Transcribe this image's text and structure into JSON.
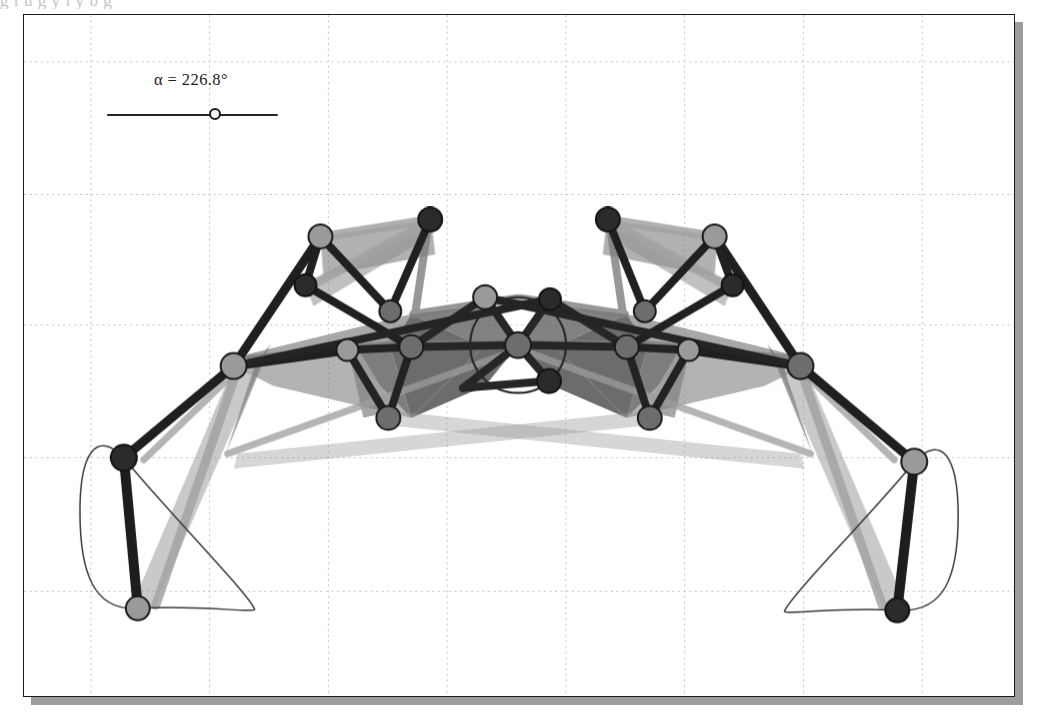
{
  "page": {
    "background": "#ffffff",
    "bleed_text": "g           l     u     g  y     l  y       b     g",
    "width": 1044,
    "height": 718
  },
  "applet": {
    "frame": {
      "x": 23,
      "y": 14,
      "width": 992,
      "height": 683,
      "border_color": "#1b1b1b",
      "background": "#ffffff",
      "shadow_color": "#9d9d9d",
      "shadow_offset": 8
    },
    "grid": {
      "visible": true,
      "style": "dotted",
      "color": "#c9c9c9",
      "x_lines": [
        90,
        209,
        328,
        447,
        566,
        685,
        804,
        923
      ],
      "y_lines": [
        61,
        194,
        325,
        458,
        592
      ],
      "spacing_x": 119,
      "spacing_y": 133
    }
  },
  "slider": {
    "name": "alpha",
    "label": "α = 226.8°",
    "symbol": "α",
    "value": 226.8,
    "unit": "°",
    "min": 0,
    "max": 360,
    "track": {
      "x": 83,
      "y": 99,
      "length": 171
    },
    "knob_x": 189,
    "track_color": "#262626",
    "knob_fill": "#f2f2f2",
    "knob_stroke": "#1c1c1c"
  },
  "colors": {
    "joint_dark": "#2b2b2b",
    "joint_light": "#9a9a9a",
    "joint_mid": "#6d6d6d",
    "joint_outline": "#1a1a1a",
    "bar_dark": "#1d1d1d",
    "bar_mid": "#4d4d4d",
    "bar_light": "#8f8f8f",
    "ghost": "#b5b5b5",
    "trace": "#3a3a3a",
    "fill_panel": "#4a4a4a"
  },
  "mechanism": {
    "type": "klann-walking-linkage",
    "description": "Symmetric two-legged walking linkage driven by a central crank circle",
    "crank_circle": {
      "cx": 518,
      "cy": 345,
      "r": 48,
      "stroke": "#2a2a2a"
    },
    "joints": [
      {
        "id": "hub",
        "x": 518,
        "y": 345,
        "r": 13,
        "shade": "mid"
      },
      {
        "id": "c-tl",
        "x": 485,
        "y": 297,
        "r": 12,
        "shade": "light"
      },
      {
        "id": "c-tr",
        "x": 550,
        "y": 299,
        "r": 11,
        "shade": "dark"
      },
      {
        "id": "c-br",
        "x": 549,
        "y": 381,
        "r": 12,
        "shade": "dark"
      },
      {
        "id": "L-top",
        "x": 320,
        "y": 236,
        "r": 12,
        "shade": "light"
      },
      {
        "id": "L-upper",
        "x": 305,
        "y": 285,
        "r": 11,
        "shade": "dark"
      },
      {
        "id": "L-peak",
        "x": 430,
        "y": 219,
        "r": 12,
        "shade": "dark"
      },
      {
        "id": "L-mid",
        "x": 390,
        "y": 311,
        "r": 11,
        "shade": "mid"
      },
      {
        "id": "L-inner",
        "x": 411,
        "y": 347,
        "r": 12,
        "shade": "mid"
      },
      {
        "id": "L-knee",
        "x": 347,
        "y": 350,
        "r": 11,
        "shade": "light"
      },
      {
        "id": "L-hip",
        "x": 233,
        "y": 366,
        "r": 13,
        "shade": "light"
      },
      {
        "id": "L-low",
        "x": 388,
        "y": 418,
        "r": 12,
        "shade": "mid"
      },
      {
        "id": "L-ankle",
        "x": 123,
        "y": 458,
        "r": 13,
        "shade": "dark"
      },
      {
        "id": "L-foot",
        "x": 137,
        "y": 609,
        "r": 12,
        "shade": "light"
      },
      {
        "id": "R-top",
        "x": 715,
        "y": 236,
        "r": 12,
        "shade": "light"
      },
      {
        "id": "R-upper",
        "x": 733,
        "y": 285,
        "r": 11,
        "shade": "dark"
      },
      {
        "id": "R-peak",
        "x": 608,
        "y": 219,
        "r": 12,
        "shade": "dark"
      },
      {
        "id": "R-mid",
        "x": 648,
        "y": 311,
        "r": 11,
        "shade": "mid"
      },
      {
        "id": "R-inner",
        "x": 625,
        "y": 347,
        "r": 12,
        "shade": "mid"
      },
      {
        "id": "R-knee",
        "x": 689,
        "y": 350,
        "r": 11,
        "shade": "light"
      },
      {
        "id": "R-hip",
        "x": 801,
        "y": 366,
        "r": 13,
        "shade": "mid"
      },
      {
        "id": "R-low",
        "x": 650,
        "y": 418,
        "r": 12,
        "shade": "mid"
      },
      {
        "id": "R-ankle",
        "x": 915,
        "y": 462,
        "r": 13,
        "shade": "light"
      },
      {
        "id": "R-foot",
        "x": 898,
        "y": 611,
        "r": 12,
        "shade": "dark"
      }
    ],
    "foot_paths": [
      {
        "id": "left-foot-trace",
        "d": "M 123 458 C 96 430 79 452 79 512 C 79 572 92 612 137 609 C 196 605 252 614 254 610 C 250 596 154 498 123 458 Z"
      },
      {
        "id": "right-foot-trace",
        "d": "M 915 462 C 942 434 959 456 959 516 C 959 576 946 614 898 611 C 841 607 787 616 785 612 C 789 598 884 502 915 462 Z"
      }
    ]
  }
}
